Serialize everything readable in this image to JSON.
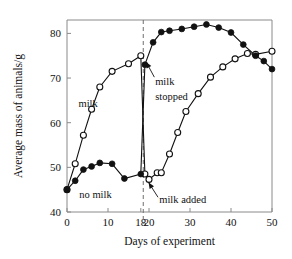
{
  "chart_data": {
    "type": "line",
    "title": "",
    "xlabel": "Days of experiment",
    "ylabel": "Average mass of animals/g",
    "xlim": [
      0,
      50
    ],
    "ylim": [
      40,
      83
    ],
    "xticks": [
      0,
      10,
      18,
      20,
      30,
      40,
      50
    ],
    "xtick_labels": [
      "0",
      "10",
      "18",
      "20",
      "30",
      "40",
      "50"
    ],
    "yticks": [
      40,
      50,
      60,
      70,
      80
    ],
    "ytick_labels": [
      "40",
      "50",
      "60",
      "70",
      "80"
    ],
    "grid": false,
    "legend_position": "inline-annotations",
    "series": [
      {
        "name": "milk",
        "marker": "open-circle",
        "label": "milk",
        "points": [
          {
            "x": 0,
            "y": 45.0
          },
          {
            "x": 2,
            "y": 50.8
          },
          {
            "x": 4,
            "y": 57.2
          },
          {
            "x": 6,
            "y": 63.0
          },
          {
            "x": 8,
            "y": 68.0
          },
          {
            "x": 11,
            "y": 71.5
          },
          {
            "x": 15,
            "y": 73.2
          },
          {
            "x": 18,
            "y": 75.0
          },
          {
            "x": 19,
            "y": 48.5
          },
          {
            "x": 20,
            "y": 47.3
          },
          {
            "x": 22,
            "y": 48.8
          },
          {
            "x": 23,
            "y": 48.8
          },
          {
            "x": 25,
            "y": 53.0
          },
          {
            "x": 27,
            "y": 57.8
          },
          {
            "x": 29,
            "y": 62.5
          },
          {
            "x": 32,
            "y": 66.5
          },
          {
            "x": 35,
            "y": 70.2
          },
          {
            "x": 38,
            "y": 72.5
          },
          {
            "x": 41,
            "y": 74.3
          },
          {
            "x": 44,
            "y": 75.5
          },
          {
            "x": 46,
            "y": 75.3
          },
          {
            "x": 50,
            "y": 76.0
          }
        ]
      },
      {
        "name": "no milk",
        "marker": "filled-circle",
        "label": "no milk",
        "points": [
          {
            "x": 0,
            "y": 45.0
          },
          {
            "x": 2,
            "y": 47.0
          },
          {
            "x": 4,
            "y": 49.5
          },
          {
            "x": 6,
            "y": 50.2
          },
          {
            "x": 8,
            "y": 51.0
          },
          {
            "x": 11,
            "y": 50.8
          },
          {
            "x": 14,
            "y": 47.5
          },
          {
            "x": 18,
            "y": 48.5
          },
          {
            "x": 19,
            "y": 73.0
          },
          {
            "x": 21,
            "y": 78.0
          },
          {
            "x": 23,
            "y": 80.3
          },
          {
            "x": 25,
            "y": 80.6
          },
          {
            "x": 28,
            "y": 81.0
          },
          {
            "x": 31,
            "y": 81.5
          },
          {
            "x": 34,
            "y": 82.0
          },
          {
            "x": 37,
            "y": 81.3
          },
          {
            "x": 40,
            "y": 80.2
          },
          {
            "x": 43,
            "y": 77.5
          },
          {
            "x": 46,
            "y": 75.0
          },
          {
            "x": 48,
            "y": 73.8
          },
          {
            "x": 50,
            "y": 72.0
          }
        ]
      }
    ],
    "annotations": [
      {
        "id": "milk-label",
        "text": "milk",
        "x": 7.5,
        "y": 63.5
      },
      {
        "id": "no-milk-label",
        "text": "no milk",
        "x": 3.0,
        "y": 43.2
      },
      {
        "id": "milk-stopped-line1",
        "text": "milk",
        "x": 21.5,
        "y": 68.5
      },
      {
        "id": "milk-stopped-line2",
        "text": "stopped",
        "x": 21.5,
        "y": 65.0
      },
      {
        "id": "milk-added",
        "text": "milk added",
        "x": 22.5,
        "y": 42.0
      },
      {
        "id": "event-marker",
        "text": "",
        "x": 18.5,
        "y": 0
      }
    ]
  },
  "colors": {
    "background": "#ffffff",
    "ink": "#111111",
    "axis": "#8a8a8a",
    "event_line": "#6f6f6f"
  }
}
